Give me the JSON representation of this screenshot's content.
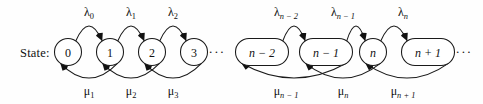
{
  "figure": {
    "kind": "markov-birth-death-chain",
    "background_color": "#fefefe",
    "stroke_color": "#1a1a1a",
    "text_color": "#111111",
    "row_label": "State:",
    "width": 483,
    "height": 104
  },
  "nodes": [
    {
      "id": "s0",
      "label": "0",
      "shape": "circle",
      "cx": 68,
      "cy": 52,
      "rx": 13.5,
      "ry": 13.5,
      "italic": false
    },
    {
      "id": "s1",
      "label": "1",
      "shape": "circle",
      "cx": 110,
      "cy": 52,
      "rx": 13.5,
      "ry": 13.5,
      "italic": false
    },
    {
      "id": "s2",
      "label": "2",
      "shape": "circle",
      "cx": 152,
      "cy": 52,
      "rx": 13.5,
      "ry": 13.5,
      "italic": false
    },
    {
      "id": "s3",
      "label": "3",
      "shape": "circle",
      "cx": 194,
      "cy": 52,
      "rx": 13.5,
      "ry": 13.5,
      "italic": false
    },
    {
      "id": "sn-2",
      "label": "n − 2",
      "shape": "stadium",
      "cx": 262,
      "cy": 52,
      "rx": 26.5,
      "ry": 13.5,
      "italic": true
    },
    {
      "id": "sn-1",
      "label": "n − 1",
      "shape": "stadium",
      "cx": 326,
      "cy": 52,
      "rx": 26.5,
      "ry": 13.5,
      "italic": true
    },
    {
      "id": "sn",
      "label": "n",
      "shape": "circle",
      "cx": 373,
      "cy": 52,
      "rx": 13.5,
      "ry": 13.5,
      "italic": true
    },
    {
      "id": "sn+1",
      "label": "n + 1",
      "shape": "stadium",
      "cx": 428,
      "cy": 52,
      "rx": 26.5,
      "ry": 13.5,
      "italic": true
    }
  ],
  "ellipses": [
    {
      "id": "gap-mid",
      "text": "···",
      "x": 217,
      "y": 56
    },
    {
      "id": "tail-right",
      "text": "···",
      "x": 464,
      "y": 56
    }
  ],
  "birth_rates": [
    {
      "id": "lambda-0",
      "symbol": "λ",
      "sub": "0",
      "from": "s0",
      "to": "s1",
      "x": 89,
      "y": 16,
      "sub_italic": false
    },
    {
      "id": "lambda-1",
      "symbol": "λ",
      "sub": "1",
      "from": "s1",
      "to": "s2",
      "x": 131,
      "y": 16,
      "sub_italic": false
    },
    {
      "id": "lambda-2",
      "symbol": "λ",
      "sub": "2",
      "from": "s2",
      "to": "s3",
      "x": 173,
      "y": 16,
      "sub_italic": false
    },
    {
      "id": "lambda-n-2",
      "symbol": "λ",
      "sub": "n − 2",
      "from": "sn-2",
      "to": "sn-1",
      "x": 286,
      "y": 16,
      "sub_italic": true
    },
    {
      "id": "lambda-n-1",
      "symbol": "λ",
      "sub": "n − 1",
      "from": "sn-1",
      "to": "sn",
      "x": 343,
      "y": 16,
      "sub_italic": true
    },
    {
      "id": "lambda-n",
      "symbol": "λ",
      "sub": "n",
      "from": "sn",
      "to": "sn+1",
      "x": 403,
      "y": 16,
      "sub_italic": true
    }
  ],
  "death_rates": [
    {
      "id": "mu-1",
      "symbol": "μ",
      "sub": "1",
      "from": "s1",
      "to": "s0",
      "x": 89,
      "y": 95,
      "sub_italic": false
    },
    {
      "id": "mu-2",
      "symbol": "μ",
      "sub": "2",
      "from": "s2",
      "to": "s1",
      "x": 131,
      "y": 95,
      "sub_italic": false
    },
    {
      "id": "mu-3",
      "symbol": "μ",
      "sub": "3",
      "from": "s3",
      "to": "s2",
      "x": 173,
      "y": 95,
      "sub_italic": false
    },
    {
      "id": "mu-n-1",
      "symbol": "μ",
      "sub": "n − 1",
      "from": "sn-1",
      "to": "sn-2",
      "x": 286,
      "y": 95,
      "sub_italic": true
    },
    {
      "id": "mu-n",
      "symbol": "μ",
      "sub": "n",
      "from": "sn",
      "to": "sn-1",
      "x": 343,
      "y": 95,
      "sub_italic": true
    },
    {
      "id": "mu-n+1",
      "symbol": "μ",
      "sub": "n + 1",
      "from": "sn+1",
      "to": "sn",
      "x": 403,
      "y": 95,
      "sub_italic": true
    }
  ]
}
